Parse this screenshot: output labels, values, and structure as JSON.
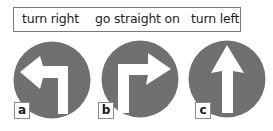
{
  "word_box": {
    "words": [
      {
        "text": "turn right",
        "x": 8
      },
      {
        "text": "go straight on",
        "x": 81
      },
      {
        "text": "turn left",
        "x": 177
      }
    ]
  },
  "signs": [
    {
      "label": "a",
      "icon": "turn-left-arrow-icon",
      "center": [
        52,
        80
      ]
    },
    {
      "label": "b",
      "icon": "turn-right-arrow-icon",
      "center": [
        140,
        79
      ]
    },
    {
      "label": "c",
      "icon": "straight-arrow-icon",
      "center": [
        227,
        79
      ]
    }
  ],
  "colors": {
    "sign_fill": "#707070",
    "arrow_fill": "#ffffff",
    "border": "#7a7a7a"
  }
}
